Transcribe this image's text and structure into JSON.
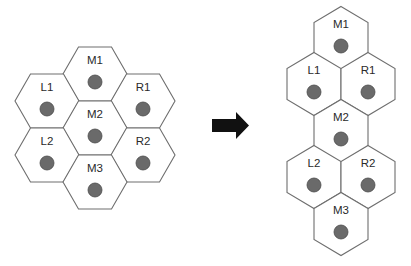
{
  "diagram": {
    "left_cluster": {
      "orientation": "flat-top",
      "cells": [
        {
          "id": "M1",
          "label": "M1",
          "cx": 95,
          "cy": 74
        },
        {
          "id": "L1",
          "label": "L1",
          "cx": 47,
          "cy": 101
        },
        {
          "id": "R1",
          "label": "R1",
          "cx": 143,
          "cy": 101
        },
        {
          "id": "M2",
          "label": "M2",
          "cx": 95,
          "cy": 128
        },
        {
          "id": "L2",
          "label": "L2",
          "cx": 47,
          "cy": 155
        },
        {
          "id": "R2",
          "label": "R2",
          "cx": 143,
          "cy": 155
        },
        {
          "id": "M3",
          "label": "M3",
          "cx": 95,
          "cy": 182
        }
      ]
    },
    "arrow": {
      "direction": "right",
      "color": "#111111"
    },
    "right_cluster": {
      "orientation": "pointy-top",
      "cells": [
        {
          "id": "M1",
          "label": "M1",
          "cx": 341,
          "cy": 38
        },
        {
          "id": "L1",
          "label": "L1",
          "cx": 314,
          "cy": 84
        },
        {
          "id": "R1",
          "label": "R1",
          "cx": 368,
          "cy": 84
        },
        {
          "id": "M2",
          "label": "M2",
          "cx": 341,
          "cy": 131
        },
        {
          "id": "L2",
          "label": "L2",
          "cx": 314,
          "cy": 177
        },
        {
          "id": "R2",
          "label": "R2",
          "cx": 368,
          "cy": 177
        },
        {
          "id": "M3",
          "label": "M3",
          "cx": 341,
          "cy": 224
        }
      ]
    },
    "colors": {
      "hex_stroke": "#6e6e6e",
      "dot_fill": "#6a6a6a",
      "background": "#ffffff"
    }
  }
}
